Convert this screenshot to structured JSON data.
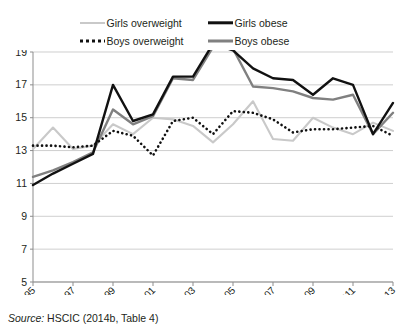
{
  "legend": {
    "items": [
      {
        "label": "Girls overweight",
        "style": "solid-light-gray",
        "color": "#c9c9c9",
        "icon": "line-swatch-icon"
      },
      {
        "label": "Girls obese",
        "style": "solid-black",
        "color": "#111111",
        "icon": "line-swatch-icon"
      },
      {
        "label": "Boys overweight",
        "style": "dotted-black",
        "color": "#111111",
        "icon": "dotted-line-swatch-icon"
      },
      {
        "label": "Boys obese",
        "style": "solid-gray",
        "color": "#808080",
        "icon": "line-swatch-icon"
      }
    ]
  },
  "source": {
    "prefix": "Source:",
    "text": "HSCIC (2014b, Table 4)"
  },
  "chart_data": {
    "type": "line",
    "title": "",
    "xlabel": "",
    "ylabel": "",
    "xlim": [
      1995,
      2013
    ],
    "ylim": [
      5,
      19
    ],
    "yticks": [
      5,
      7,
      9,
      11,
      13,
      15,
      17,
      19
    ],
    "xticks": [
      1995,
      1997,
      1999,
      2001,
      2003,
      2005,
      2007,
      2009,
      2011,
      2013
    ],
    "x": [
      1995,
      1996,
      1997,
      1998,
      1999,
      2000,
      2001,
      2002,
      2003,
      2004,
      2005,
      2006,
      2007,
      2008,
      2009,
      2010,
      2011,
      2012,
      2013
    ],
    "grid": true,
    "legend_position": "top",
    "series": [
      {
        "name": "Girls overweight",
        "color": "#c9c9c9",
        "style": "solid",
        "values": [
          13.1,
          14.4,
          13.1,
          13.3,
          14.6,
          14.0,
          15.0,
          14.9,
          14.5,
          13.5,
          14.6,
          16.0,
          13.7,
          13.6,
          15.0,
          14.4,
          14.0,
          14.7,
          14.2
        ]
      },
      {
        "name": "Girls obese",
        "color": "#111111",
        "style": "solid",
        "values": [
          10.9,
          11.6,
          12.2,
          12.8,
          17.0,
          14.8,
          15.2,
          17.5,
          17.5,
          19.5,
          19.1,
          18.0,
          17.4,
          17.3,
          16.4,
          17.4,
          17.0,
          14.0,
          15.9
        ]
      },
      {
        "name": "Boys overweight",
        "color": "#111111",
        "style": "dotted",
        "values": [
          13.3,
          13.3,
          13.2,
          13.3,
          14.2,
          13.9,
          12.7,
          14.8,
          15.0,
          14.0,
          15.4,
          15.3,
          14.9,
          14.1,
          14.3,
          14.3,
          14.4,
          14.5,
          13.9
        ]
      },
      {
        "name": "Boys obese",
        "color": "#808080",
        "style": "solid",
        "values": [
          11.4,
          11.8,
          12.3,
          12.9,
          15.5,
          14.6,
          15.1,
          17.4,
          17.3,
          19.3,
          19.2,
          16.9,
          16.8,
          16.6,
          16.2,
          16.1,
          16.4,
          14.0,
          15.3
        ]
      }
    ]
  }
}
